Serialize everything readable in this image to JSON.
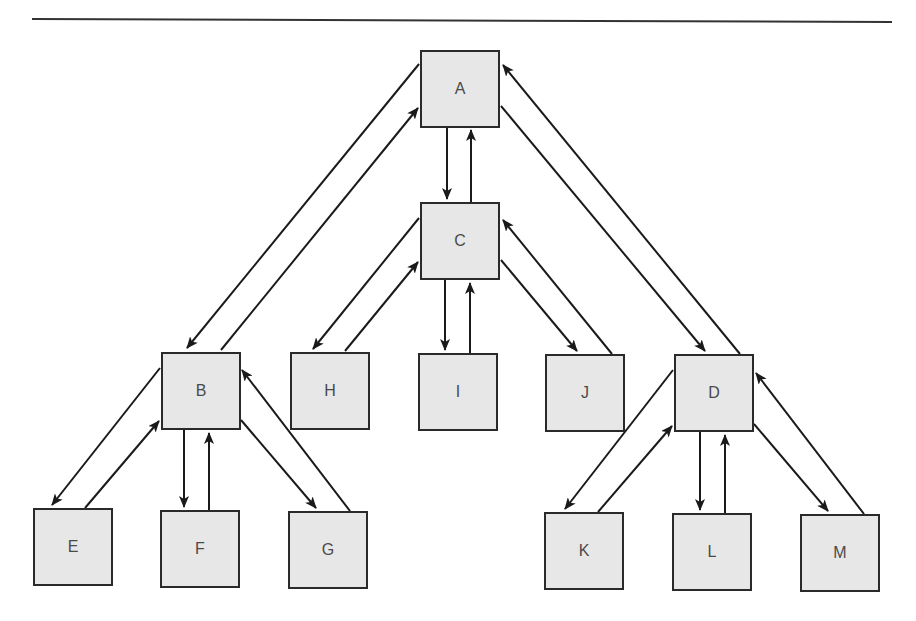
{
  "diagram": {
    "type": "tree",
    "nodes": [
      {
        "id": "A",
        "label": "A",
        "x": 420,
        "y": 50
      },
      {
        "id": "C",
        "label": "C",
        "x": 420,
        "y": 202
      },
      {
        "id": "B",
        "label": "B",
        "x": 161,
        "y": 352
      },
      {
        "id": "H",
        "label": "H",
        "x": 290,
        "y": 352
      },
      {
        "id": "I",
        "label": "I",
        "x": 418,
        "y": 353
      },
      {
        "id": "J",
        "label": "J",
        "x": 545,
        "y": 354
      },
      {
        "id": "D",
        "label": "D",
        "x": 674,
        "y": 354
      },
      {
        "id": "E",
        "label": "E",
        "x": 33,
        "y": 508
      },
      {
        "id": "F",
        "label": "F",
        "x": 160,
        "y": 510
      },
      {
        "id": "G",
        "label": "G",
        "x": 288,
        "y": 511
      },
      {
        "id": "K",
        "label": "K",
        "x": 544,
        "y": 512
      },
      {
        "id": "L",
        "label": "L",
        "x": 672,
        "y": 513
      },
      {
        "id": "M",
        "label": "M",
        "x": 800,
        "y": 514
      }
    ],
    "edges": [
      {
        "from": "A",
        "to": "B",
        "x1": 419,
        "y1": 64,
        "x2": 187,
        "y2": 348
      },
      {
        "from": "B",
        "to": "A",
        "x1": 221,
        "y1": 350,
        "x2": 418,
        "y2": 108
      },
      {
        "from": "A",
        "to": "C",
        "x1": 447,
        "y1": 128,
        "x2": 447,
        "y2": 199
      },
      {
        "from": "C",
        "to": "A",
        "x1": 471,
        "y1": 202,
        "x2": 471,
        "y2": 130
      },
      {
        "from": "A",
        "to": "D",
        "x1": 501,
        "y1": 106,
        "x2": 705,
        "y2": 351
      },
      {
        "from": "D",
        "to": "A",
        "x1": 740,
        "y1": 354,
        "x2": 503,
        "y2": 65
      },
      {
        "from": "C",
        "to": "H",
        "x1": 419,
        "y1": 218,
        "x2": 313,
        "y2": 349
      },
      {
        "from": "H",
        "to": "C",
        "x1": 345,
        "y1": 351,
        "x2": 418,
        "y2": 262
      },
      {
        "from": "C",
        "to": "I",
        "x1": 445,
        "y1": 280,
        "x2": 445,
        "y2": 350
      },
      {
        "from": "I",
        "to": "C",
        "x1": 470,
        "y1": 353,
        "x2": 470,
        "y2": 283
      },
      {
        "from": "C",
        "to": "J",
        "x1": 501,
        "y1": 260,
        "x2": 577,
        "y2": 351
      },
      {
        "from": "J",
        "to": "C",
        "x1": 612,
        "y1": 354,
        "x2": 503,
        "y2": 220
      },
      {
        "from": "B",
        "to": "E",
        "x1": 160,
        "y1": 368,
        "x2": 52,
        "y2": 505
      },
      {
        "from": "E",
        "to": "B",
        "x1": 85,
        "y1": 508,
        "x2": 159,
        "y2": 421
      },
      {
        "from": "B",
        "to": "F",
        "x1": 184,
        "y1": 430,
        "x2": 184,
        "y2": 507
      },
      {
        "from": "F",
        "to": "B",
        "x1": 209,
        "y1": 510,
        "x2": 209,
        "y2": 433
      },
      {
        "from": "B",
        "to": "G",
        "x1": 241,
        "y1": 420,
        "x2": 316,
        "y2": 508
      },
      {
        "from": "G",
        "to": "B",
        "x1": 350,
        "y1": 511,
        "x2": 242,
        "y2": 370
      },
      {
        "from": "D",
        "to": "K",
        "x1": 673,
        "y1": 370,
        "x2": 565,
        "y2": 509
      },
      {
        "from": "K",
        "to": "D",
        "x1": 598,
        "y1": 512,
        "x2": 672,
        "y2": 426
      },
      {
        "from": "D",
        "to": "L",
        "x1": 700,
        "y1": 432,
        "x2": 700,
        "y2": 510
      },
      {
        "from": "L",
        "to": "D",
        "x1": 725,
        "y1": 513,
        "x2": 725,
        "y2": 435
      },
      {
        "from": "D",
        "to": "M",
        "x1": 754,
        "y1": 424,
        "x2": 828,
        "y2": 511
      },
      {
        "from": "M",
        "to": "D",
        "x1": 864,
        "y1": 514,
        "x2": 756,
        "y2": 373
      }
    ]
  },
  "colors": {
    "node_fill": "#e7e7e7",
    "node_border": "#2a2a2a",
    "label": "#4a4a4a",
    "edge": "#1a1a1a"
  }
}
